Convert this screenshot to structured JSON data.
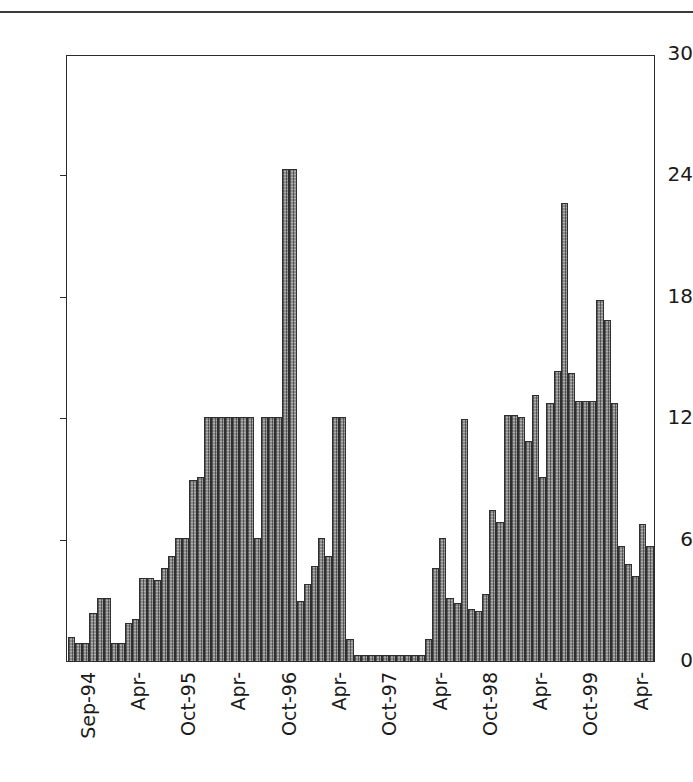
{
  "figure": {
    "rule_present": true
  },
  "chart_data": {
    "type": "bar",
    "title": "",
    "subtitle": "",
    "xlabel": "",
    "ylabel": "",
    "ylim": [
      0,
      30
    ],
    "yticks": [
      0,
      6,
      12,
      18,
      24,
      30
    ],
    "ytick_labels": [
      "0",
      "6",
      "12",
      "18",
      "24",
      "30"
    ],
    "grid": false,
    "legend": null,
    "bar_color": "#8c8c8c",
    "bar_edge_color": "#2f2f2f",
    "axis_color": "#2b2b2b",
    "xtick_labels": [
      "Sep-94",
      "Apr-",
      "Oct-95",
      "Apr-",
      "Oct-96",
      "Apr-",
      "Oct-97",
      "Apr-",
      "Oct-98",
      "Apr-",
      "Oct-99",
      "Apr-",
      "Oct-00",
      "Apr-"
    ],
    "xtick_interval_months": 7,
    "xtick_first_index": 0,
    "categories": [
      "Sep-94",
      "Oct-94",
      "Nov-94",
      "Dec-94",
      "Jan-95",
      "Feb-95",
      "Mar-95",
      "Apr-95",
      "May-95",
      "Jun-95",
      "Jul-95",
      "Aug-95",
      "Sep-95",
      "Oct-95",
      "Nov-95",
      "Dec-95",
      "Jan-96",
      "Feb-96",
      "Mar-96",
      "Apr-96",
      "May-96",
      "Jun-96",
      "Jul-96",
      "Aug-96",
      "Sep-96",
      "Oct-96",
      "Nov-96",
      "Dec-96",
      "Jan-97",
      "Feb-97",
      "Mar-97",
      "Apr-97",
      "May-97",
      "Jun-97",
      "Jul-97",
      "Aug-97",
      "Sep-97",
      "Oct-97",
      "Nov-97",
      "Dec-97",
      "Jan-98",
      "Feb-98",
      "Mar-98",
      "Apr-98",
      "May-98",
      "Jun-98",
      "Jul-98",
      "Aug-98",
      "Sep-98",
      "Oct-98",
      "Nov-98",
      "Dec-98",
      "Jan-99",
      "Feb-99",
      "Mar-99",
      "Apr-99",
      "May-99",
      "Jun-99",
      "Jul-99",
      "Aug-99",
      "Sep-99",
      "Oct-99",
      "Nov-99",
      "Dec-99",
      "Jan-00",
      "Feb-00",
      "Mar-00",
      "Apr-00",
      "May-00",
      "Jun-00",
      "Jul-00",
      "Aug-00",
      "Sep-00",
      "Oct-00",
      "Nov-00",
      "Dec-00",
      "Jan-01",
      "Feb-01",
      "Mar-01",
      "Apr-01",
      "May-01",
      "Jun-01"
    ],
    "values": [
      1.2,
      0.9,
      0.9,
      2.4,
      3.1,
      3.1,
      0.9,
      0.9,
      1.9,
      2.1,
      4.1,
      4.1,
      4.0,
      4.6,
      5.2,
      6.1,
      6.1,
      9.0,
      9.1,
      12.1,
      12.1,
      12.1,
      12.1,
      12.1,
      12.1,
      12.1,
      6.1,
      12.1,
      12.1,
      12.1,
      24.4,
      24.4,
      3.0,
      3.8,
      4.7,
      6.1,
      5.2,
      12.1,
      12.1,
      1.1,
      0.3,
      0.3,
      0.3,
      0.3,
      0.3,
      0.3,
      0.3,
      0.3,
      0.3,
      0.3,
      1.1,
      4.6,
      6.1,
      3.1,
      2.9,
      12.0,
      2.6,
      2.5,
      3.3,
      7.5,
      6.9,
      12.2,
      12.2,
      12.1,
      10.9,
      13.2,
      9.1,
      12.8,
      14.4,
      22.7,
      14.3,
      12.9,
      12.9,
      12.9,
      17.9,
      16.9,
      12.8,
      5.7,
      4.8,
      4.2,
      6.8,
      5.7
    ]
  }
}
